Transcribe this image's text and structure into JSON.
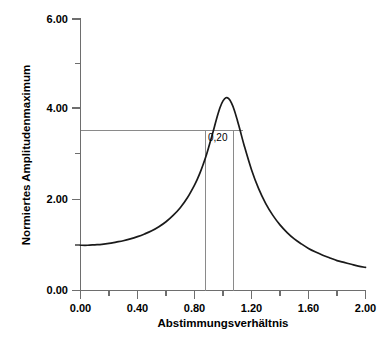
{
  "chart_data": {
    "type": "line",
    "title": "",
    "subtitle": "",
    "xlabel": "Abstimmungsverhältnis",
    "ylabel": "Normiertes Amplitudenmaximum",
    "xlim": [
      0.0,
      2.0
    ],
    "ylim": [
      0.0,
      6.0
    ],
    "grid": false,
    "legend": null,
    "x_ticks_major": [
      "0.00",
      "0.40",
      "0.80",
      "1.20",
      "1.60",
      "2.00"
    ],
    "x_ticks_major_values": [
      0.0,
      0.4,
      0.8,
      1.2,
      1.6,
      2.0
    ],
    "x_ticks_minor_values": [
      0.2,
      0.6,
      1.0,
      1.4,
      1.8
    ],
    "y_ticks_major": [
      "0.00",
      "2.00",
      "4.00",
      "6.00"
    ],
    "y_ticks_major_values": [
      0.0,
      2.0,
      4.0,
      6.0
    ],
    "y_ticks_minor_values": [
      1.0,
      3.0,
      5.0
    ],
    "series": [
      {
        "name": "Vergrößerungsfunktion D = 0,20",
        "x": [
          0.0,
          0.05,
          0.1,
          0.15,
          0.2,
          0.25,
          0.3,
          0.35,
          0.4,
          0.45,
          0.5,
          0.55,
          0.6,
          0.65,
          0.7,
          0.75,
          0.8,
          0.82,
          0.84,
          0.86,
          0.88,
          0.9,
          0.92,
          0.94,
          0.96,
          0.98,
          1.0,
          1.02,
          1.04,
          1.06,
          1.08,
          1.1,
          1.12,
          1.15,
          1.2,
          1.25,
          1.3,
          1.35,
          1.4,
          1.45,
          1.5,
          1.55,
          1.6,
          1.65,
          1.7,
          1.75,
          1.8,
          1.85,
          1.9,
          1.95,
          2.0
        ],
        "y": [
          1.0,
          1.0,
          1.01,
          1.02,
          1.04,
          1.07,
          1.1,
          1.14,
          1.19,
          1.25,
          1.32,
          1.41,
          1.52,
          1.66,
          1.83,
          2.05,
          2.33,
          2.46,
          2.61,
          2.78,
          2.96,
          3.17,
          3.39,
          3.62,
          3.85,
          4.05,
          4.19,
          4.26,
          4.24,
          4.14,
          3.98,
          3.77,
          3.54,
          3.19,
          2.67,
          2.25,
          1.92,
          1.66,
          1.45,
          1.28,
          1.14,
          1.03,
          0.93,
          0.85,
          0.78,
          0.72,
          0.66,
          0.62,
          0.58,
          0.54,
          0.51
        ]
      }
    ],
    "annotations": [
      {
        "name": "bandwidth-label",
        "text": "0,20",
        "x": 0.895,
        "y": 3.3
      }
    ],
    "reference_lines": [
      {
        "name": "half-power-horizontal",
        "orientation": "horizontal",
        "value": 3.54,
        "x_from": 0.0,
        "x_to": 1.14
      },
      {
        "name": "bandwidth-left-vertical",
        "orientation": "vertical",
        "value": 0.878,
        "y_from": 0.0,
        "y_to": 3.54
      },
      {
        "name": "bandwidth-right-vertical",
        "orientation": "vertical",
        "value": 1.073,
        "y_from": 0.0,
        "y_to": 3.54
      }
    ],
    "peak": {
      "x": 0.96,
      "y": 5.0
    },
    "colors": {
      "curve": "#1a1a1a",
      "axis": "#6e6e6e",
      "guide": "#8a8a8a",
      "text": "#000000",
      "background": "#ffffff"
    }
  }
}
